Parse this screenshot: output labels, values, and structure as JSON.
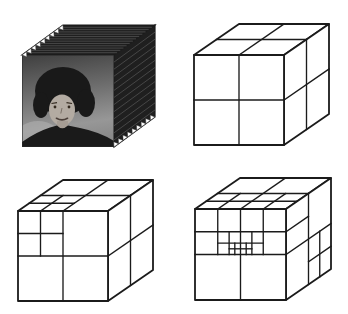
{
  "figure": {
    "background_color": "#ffffff",
    "line_color": "#1b1b1b",
    "stroke": {
      "outer": 1.8,
      "inner": 1.35
    }
  },
  "video_cube": {
    "id": "image-sequence-cube",
    "geometry": {
      "x0": 22,
      "y0": 55,
      "size": 92,
      "dx": 41,
      "dy": -30
    },
    "stack": {
      "fill": "#1f1f1f",
      "hatch_color": "#585858",
      "hatch_lines": 13,
      "tooth_count": 9,
      "tooth_color": "#ffffff"
    },
    "photo": {
      "bg_top": "#3f3f3f",
      "bg_mid": "#6e6e6e",
      "bg_low": "#979797",
      "bg_bottom": "#8a8a8a",
      "light_patch": "#adadad",
      "hair": "#191919",
      "skin": "#b3aba2",
      "neck": "#a69d94",
      "feature": "#33291f",
      "mouth": "#4c413b",
      "clothing": "#1a1a1a"
    }
  },
  "octree_cubes": [
    {
      "id": "octree-level-1",
      "geometry": {
        "x0": 194,
        "y0": 55,
        "size": 90,
        "dx": 45,
        "dy": -31
      },
      "front": [
        [
          0.5,
          0,
          0.5,
          1
        ],
        [
          0,
          0.5,
          1,
          0.5
        ]
      ],
      "top": [
        [
          0.5,
          0,
          0.5,
          1
        ],
        [
          0,
          0.5,
          1,
          0.5
        ]
      ],
      "right": [
        [
          0.5,
          0,
          0.5,
          1
        ],
        [
          0,
          0.5,
          1,
          0.5
        ]
      ]
    },
    {
      "id": "octree-level-2",
      "geometry": {
        "x0": 18,
        "y0": 211,
        "size": 90,
        "dx": 45,
        "dy": -31
      },
      "front": [
        [
          0.5,
          0,
          0.5,
          1
        ],
        [
          0,
          0.5,
          1,
          0.5
        ],
        [
          0.25,
          0,
          0.25,
          0.5
        ],
        [
          0,
          0.25,
          0.5,
          0.25
        ]
      ],
      "top": [
        [
          0.5,
          0,
          0.5,
          1
        ],
        [
          0,
          0.5,
          1,
          0.5
        ],
        [
          0.25,
          0,
          0.25,
          0.5
        ],
        [
          0,
          0.25,
          0.5,
          0.25
        ]
      ],
      "right": [
        [
          0.5,
          0,
          0.5,
          1
        ],
        [
          0,
          0.5,
          1,
          0.5
        ]
      ]
    },
    {
      "id": "octree-level-3",
      "geometry": {
        "x0": 195,
        "y0": 209,
        "size": 91,
        "dx": 45,
        "dy": -31
      },
      "front": [
        [
          0,
          0.5,
          1,
          0.5
        ],
        [
          0.5,
          0,
          0.5,
          1
        ],
        [
          0,
          0.25,
          1,
          0.25
        ],
        [
          0.25,
          0,
          0.25,
          0.5
        ],
        [
          0.75,
          0,
          0.75,
          0.5
        ],
        [
          0.25,
          0.375,
          0.75,
          0.375
        ],
        [
          0.375,
          0.25,
          0.375,
          0.5
        ],
        [
          0.625,
          0.25,
          0.625,
          0.5
        ],
        [
          0.375,
          0.4375,
          0.625,
          0.4375
        ],
        [
          0.4375,
          0.375,
          0.4375,
          0.5
        ],
        [
          0.5625,
          0.375,
          0.5625,
          0.5
        ]
      ],
      "top": [
        [
          0,
          0.5,
          1,
          0.5
        ],
        [
          0,
          0.25,
          1,
          0.25
        ],
        [
          0.5,
          0,
          0.5,
          1
        ],
        [
          0.25,
          0,
          0.25,
          0.5
        ],
        [
          0.75,
          0,
          0.75,
          0.5
        ]
      ],
      "right": [
        [
          0.5,
          0,
          0.5,
          1
        ],
        [
          0,
          0.5,
          1,
          0.5
        ],
        [
          0,
          0.25,
          0.5,
          0.25
        ],
        [
          0.75,
          0.5,
          0.75,
          1
        ],
        [
          0.5,
          0.75,
          1,
          0.75
        ]
      ]
    }
  ]
}
